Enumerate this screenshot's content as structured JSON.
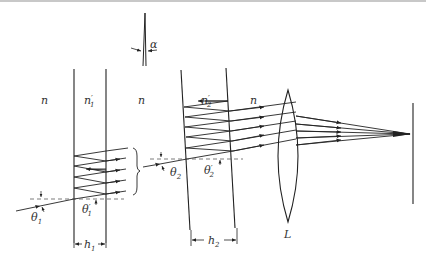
{
  "diagram": {
    "type": "optics",
    "labels": {
      "n_left": "n",
      "n1_prime": "n",
      "n1_prime_sub": "1",
      "n_middle": "n",
      "n2_prime": "n",
      "n2_prime_sub": "2",
      "n_right": "n",
      "alpha": "α",
      "theta1": "θ",
      "theta1_sub": "1",
      "theta1_prime": "θ",
      "theta1_prime_sub": "1",
      "theta2": "θ",
      "theta2_sub": "2",
      "theta2_prime": "θ",
      "theta2_prime_sub": "2",
      "h1": "h",
      "h1_sub": "1",
      "h2": "h",
      "h2_sub": "2",
      "lens": "L",
      "prime": "′"
    },
    "colors": {
      "line": "#222222",
      "text": "#333333",
      "background": "#ffffff"
    }
  }
}
